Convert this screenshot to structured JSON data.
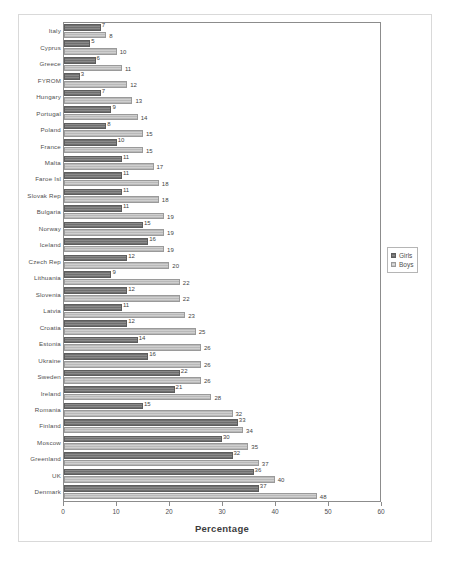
{
  "chart_data": {
    "type": "bar",
    "orientation": "horizontal",
    "title": "",
    "xlabel": "Percentage",
    "ylabel": "",
    "xlim": [
      0,
      60
    ],
    "xticks": [
      "0",
      "10",
      "20",
      "30",
      "40",
      "50",
      "60"
    ],
    "grid": false,
    "legend_position": "right",
    "categories": [
      "Italy",
      "Cyprus",
      "Greece",
      "FYROM",
      "Hungary",
      "Portugal",
      "Poland",
      "France",
      "Malta",
      "Faroe Isl",
      "Slovak Rep",
      "Bulgaria",
      "Norway",
      "Iceland",
      "Czech Rep",
      "Lithuania",
      "Slovenia",
      "Latvia",
      "Croatia",
      "Estonia",
      "Ukraine",
      "Sweden",
      "Ireland",
      "Romania",
      "Finland",
      "Moscow",
      "Greenland",
      "UK",
      "Denmark"
    ],
    "series": [
      {
        "name": "Girls",
        "color": "#8a8a8a",
        "values": [
          7,
          5,
          6,
          3,
          7,
          9,
          8,
          10,
          11,
          11,
          11,
          11,
          15,
          16,
          12,
          9,
          12,
          11,
          12,
          14,
          16,
          22,
          21,
          15,
          33,
          30,
          32,
          36,
          37
        ]
      },
      {
        "name": "Boys",
        "color": "#cfcfcf",
        "values": [
          8,
          10,
          11,
          12,
          13,
          14,
          15,
          15,
          17,
          18,
          18,
          19,
          19,
          19,
          20,
          22,
          22,
          23,
          25,
          26,
          26,
          26,
          28,
          32,
          34,
          35,
          37,
          40,
          48
        ]
      }
    ]
  },
  "legend": {
    "items": [
      {
        "label": "Girls"
      },
      {
        "label": "Boys"
      }
    ]
  },
  "axis": {
    "title": "Percentage"
  }
}
